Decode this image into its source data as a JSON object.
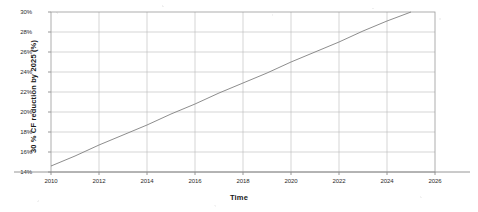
{
  "chart_data": {
    "type": "line",
    "title": "",
    "xlabel": "Time",
    "ylabel": "30 % CF reduction  by  2025 (%)",
    "xlim": [
      2010,
      2026
    ],
    "ylim": [
      14,
      30
    ],
    "grid": true,
    "legend": "none",
    "x_ticks": [
      "2010",
      "2012",
      "2014",
      "2016",
      "2018",
      "2020",
      "2022",
      "2024",
      "2026"
    ],
    "x_tick_values": [
      2010,
      2012,
      2014,
      2016,
      2018,
      2020,
      2022,
      2024,
      2026
    ],
    "y_ticks": [
      "30%",
      "28%",
      "26%",
      "24%",
      "22%",
      "20%",
      "18%",
      "16%",
      "14%"
    ],
    "y_tick_values": [
      30,
      28,
      26,
      24,
      22,
      20,
      18,
      16,
      14
    ],
    "series": [
      {
        "name": "30 % CF reduction by 2025",
        "color": "#808080",
        "x": [
          2010,
          2011,
          2012,
          2013,
          2014,
          2015,
          2016,
          2017,
          2018,
          2019,
          2020,
          2021,
          2022,
          2023,
          2024,
          2025
        ],
        "values": [
          14.6,
          15.6,
          16.7,
          17.7,
          18.7,
          19.8,
          20.8,
          21.9,
          22.9,
          23.9,
          25.0,
          26.0,
          27.0,
          28.1,
          29.1,
          30.0
        ]
      }
    ]
  },
  "axes": {
    "y_title": "30 % CF reduction  by  2025 (%)",
    "x_title": "Time"
  }
}
